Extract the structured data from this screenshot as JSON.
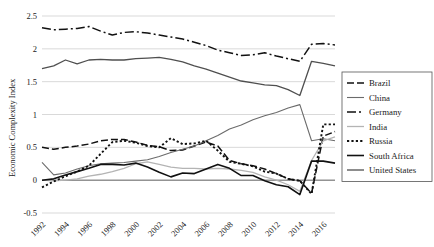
{
  "chart_data": {
    "type": "line",
    "title": "",
    "xlabel": "",
    "ylabel": "Economic Complexity Index",
    "xlim": [
      1992,
      2017
    ],
    "ylim": [
      -0.5,
      2.5
    ],
    "yticks": [
      -0.5,
      0,
      0.5,
      1,
      1.5,
      2,
      2.5
    ],
    "ytick_labels": [
      "-0.5",
      "0",
      "0.5",
      "1",
      "1.5",
      "2",
      "2.5"
    ],
    "xticks": [
      1992,
      1994,
      1996,
      1998,
      2000,
      2002,
      2004,
      2006,
      2008,
      2010,
      2012,
      2014,
      2016
    ],
    "xtick_labels": [
      "1992",
      "1994",
      "1996",
      "1998",
      "2000",
      "2002",
      "2004",
      "2006",
      "2008",
      "2010",
      "2012",
      "2014",
      "2016"
    ],
    "grid": true,
    "legend_position": "right",
    "x": [
      1992,
      1993,
      1994,
      1995,
      1996,
      1997,
      1998,
      1999,
      2000,
      2001,
      2002,
      2003,
      2004,
      2005,
      2006,
      2007,
      2008,
      2009,
      2010,
      2011,
      2012,
      2013,
      2014,
      2015,
      2016,
      2017
    ],
    "series": [
      {
        "name": "Brazil",
        "color": "#111111",
        "width": 1.5,
        "dash": "7,3",
        "values": [
          0.5,
          0.47,
          0.5,
          0.52,
          0.55,
          0.6,
          0.62,
          0.62,
          0.58,
          0.53,
          0.51,
          0.45,
          0.46,
          0.52,
          0.58,
          0.52,
          0.3,
          0.25,
          0.22,
          0.17,
          0.1,
          0.02,
          -0.01,
          -0.2,
          0.67,
          0.74
        ]
      },
      {
        "name": "China",
        "color": "#6b6b6b",
        "width": 1.1,
        "dash": "none",
        "values": [
          0.27,
          0.08,
          0.11,
          0.17,
          0.22,
          0.25,
          0.26,
          0.27,
          0.29,
          0.31,
          0.36,
          0.42,
          0.47,
          0.52,
          0.6,
          0.68,
          0.78,
          0.84,
          0.92,
          0.98,
          1.03,
          1.1,
          1.15,
          0.6,
          0.63,
          0.6
        ]
      },
      {
        "name": "Germany",
        "color": "#111111",
        "width": 1.5,
        "dash": "9,3,2,3",
        "values": [
          2.32,
          2.29,
          2.3,
          2.31,
          2.34,
          2.27,
          2.21,
          2.25,
          2.26,
          2.24,
          2.21,
          2.18,
          2.15,
          2.1,
          2.05,
          1.98,
          1.94,
          1.9,
          1.91,
          1.94,
          1.89,
          1.85,
          1.81,
          2.07,
          2.08,
          2.06
        ]
      },
      {
        "name": "India",
        "color": "#b4b4b4",
        "width": 1.3,
        "dash": "none",
        "values": [
          0.0,
          -0.01,
          0.0,
          0.02,
          0.06,
          0.09,
          0.13,
          0.18,
          0.25,
          0.28,
          0.24,
          0.2,
          0.18,
          0.18,
          0.17,
          0.18,
          0.17,
          0.15,
          0.12,
          0.05,
          0.0,
          -0.07,
          -0.17,
          0.3,
          0.6,
          0.66
        ]
      },
      {
        "name": "Russia",
        "color": "#111111",
        "width": 1.9,
        "dash": "2.2,2.2",
        "values": [
          -0.11,
          -0.02,
          0.06,
          0.13,
          0.22,
          0.4,
          0.58,
          0.6,
          0.57,
          0.52,
          0.5,
          0.64,
          0.55,
          0.56,
          0.6,
          0.45,
          0.28,
          0.25,
          0.21,
          0.13,
          0.1,
          0.02,
          -0.01,
          -0.21,
          0.85,
          0.85
        ]
      },
      {
        "name": "South Africa",
        "color": "#111111",
        "width": 1.6,
        "dash": "none",
        "values": [
          0.0,
          0.02,
          0.08,
          0.13,
          0.18,
          0.24,
          0.24,
          0.23,
          0.26,
          0.2,
          0.12,
          0.05,
          0.11,
          0.1,
          0.17,
          0.24,
          0.18,
          0.07,
          0.07,
          -0.01,
          -0.07,
          -0.1,
          -0.22,
          0.29,
          0.29,
          0.26
        ]
      },
      {
        "name": "United States",
        "color": "#4f4f4f",
        "width": 1.3,
        "dash": "none",
        "values": [
          1.7,
          1.74,
          1.83,
          1.77,
          1.83,
          1.84,
          1.83,
          1.83,
          1.85,
          1.86,
          1.87,
          1.84,
          1.8,
          1.74,
          1.69,
          1.63,
          1.57,
          1.51,
          1.48,
          1.45,
          1.44,
          1.38,
          1.29,
          1.81,
          1.78,
          1.74
        ]
      }
    ]
  },
  "legend": {
    "entries": [
      "Brazil",
      "China",
      "Germany",
      "India",
      "Russia",
      "South Africa",
      "United States"
    ]
  }
}
